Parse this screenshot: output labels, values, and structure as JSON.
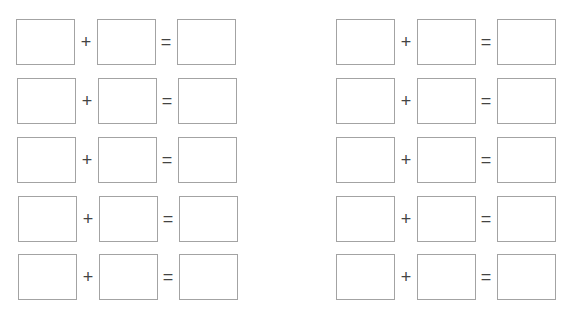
{
  "worksheet": {
    "groups": [
      {
        "rows": [
          {
            "plus": "+",
            "equals": "="
          },
          {
            "plus": "+",
            "equals": "="
          },
          {
            "plus": "+",
            "equals": "="
          },
          {
            "plus": "+",
            "equals": "="
          },
          {
            "plus": "+",
            "equals": "="
          }
        ]
      },
      {
        "rows": [
          {
            "plus": "+",
            "equals": "="
          },
          {
            "plus": "+",
            "equals": "="
          },
          {
            "plus": "+",
            "equals": "="
          },
          {
            "plus": "+",
            "equals": "="
          },
          {
            "plus": "+",
            "equals": "="
          }
        ]
      }
    ],
    "colors": {
      "box_border": "#a3a3a3",
      "operator": "#444444"
    }
  }
}
